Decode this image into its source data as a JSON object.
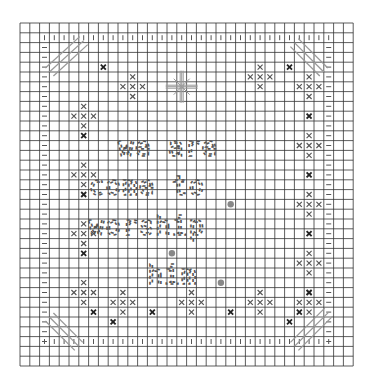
{
  "pattern": {
    "title": "we are come to worship him",
    "lines": [
      "we are",
      "come to",
      "worship",
      "him"
    ],
    "grid": {
      "left": 20,
      "top": 23,
      "cols": 34,
      "rows": 35,
      "cell": 9.8,
      "line_color": "#333333",
      "bg": "#ffffff"
    },
    "colors": {
      "symbol": "#555555",
      "dark_x": "#222222",
      "dot": "#888888",
      "diag": "#999999"
    },
    "border_plus_top_row": 1.5,
    "border_plus_bottom_row": 32.5,
    "border_plus_left_col": 2.5,
    "border_plus_right_col": 31.5,
    "corner_diagonals": [
      {
        "name": "top-left",
        "cells": [
          [
            2,
            3
          ],
          [
            3,
            2
          ],
          [
            4,
            1
          ]
        ]
      },
      {
        "name": "top-right",
        "cells": [
          [
            29,
            1
          ],
          [
            30,
            2
          ],
          [
            31,
            3
          ]
        ]
      },
      {
        "name": "bottom-left",
        "cells": [
          [
            2,
            30
          ],
          [
            3,
            31
          ],
          [
            4,
            32
          ]
        ]
      },
      {
        "name": "bottom-right",
        "cells": [
          [
            29,
            32
          ],
          [
            30,
            31
          ],
          [
            31,
            30
          ]
        ]
      }
    ],
    "flower_motifs": [
      [
        11,
        6
      ],
      [
        24,
        5
      ],
      [
        6,
        9
      ],
      [
        6,
        15
      ],
      [
        6,
        21
      ],
      [
        6,
        27
      ],
      [
        29,
        6
      ],
      [
        29,
        12
      ],
      [
        29,
        18
      ],
      [
        29,
        24
      ],
      [
        10,
        28
      ],
      [
        17,
        28
      ],
      [
        24,
        28
      ],
      [
        29,
        28
      ]
    ],
    "dark_x": [
      [
        8,
        4
      ],
      [
        27,
        4
      ],
      [
        6,
        11
      ],
      [
        6,
        17
      ],
      [
        6,
        23
      ],
      [
        29,
        9
      ],
      [
        29,
        15
      ],
      [
        29,
        21
      ],
      [
        29,
        27
      ],
      [
        7,
        29
      ],
      [
        13,
        29
      ],
      [
        21,
        29
      ],
      [
        28,
        29
      ],
      [
        9,
        30
      ],
      [
        27,
        30
      ]
    ],
    "center_star": [
      16,
      6
    ],
    "gray_dots": [
      [
        21,
        18
      ],
      [
        15,
        23
      ],
      [
        20,
        26
      ]
    ],
    "text_rows": [
      {
        "text": "we are",
        "col": 10,
        "row": 11
      },
      {
        "text": "come to",
        "col": 7,
        "row": 15
      },
      {
        "text": "worship",
        "col": 7,
        "row": 19
      },
      {
        "text": "him",
        "col": 13,
        "row": 24
      }
    ]
  }
}
